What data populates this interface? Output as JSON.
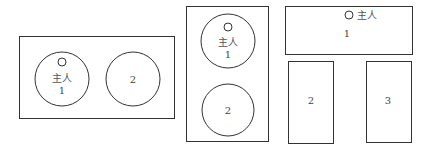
{
  "diagrams": [
    {
      "name": "two-round-tables-horizontal",
      "host_label": "主人",
      "seats": [
        {
          "label": "1",
          "host": true
        },
        {
          "label": "2",
          "host": false
        }
      ]
    },
    {
      "name": "two-round-tables-vertical",
      "host_label": "主人",
      "seats": [
        {
          "label": "1",
          "host": true
        },
        {
          "label": "2",
          "host": false
        }
      ]
    },
    {
      "name": "three-rect-tables",
      "host_label": "主人",
      "seats": [
        {
          "label": "1",
          "host": true
        },
        {
          "label": "2",
          "host": false
        },
        {
          "label": "3",
          "host": false
        }
      ]
    }
  ],
  "colors": {
    "stroke": "#333333",
    "text": "#444444",
    "background": "#ffffff"
  }
}
